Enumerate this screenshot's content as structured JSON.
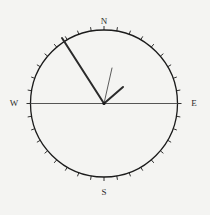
{
  "figure": {
    "name": "compass-rose-diagram",
    "background_color": "#f4f4f2",
    "width": 210,
    "height": 215
  },
  "compass": {
    "center_x": 104,
    "center_y": 103.5,
    "radius": 73.5,
    "circle_color": "#1b1b1b",
    "circle_stroke_width": 1.3,
    "tick_interval_degrees": 10,
    "tick_length": 4,
    "tick_color": "#1b1b1b",
    "tick_stroke_width": 0.9
  },
  "cardinals": [
    {
      "label": "N",
      "bearing": 0,
      "x": 104,
      "y": 22
    },
    {
      "label": "E",
      "bearing": 90,
      "x": 194,
      "y": 103.5
    },
    {
      "label": "S",
      "bearing": 180,
      "x": 104,
      "y": 193
    },
    {
      "label": "W",
      "bearing": 270,
      "x": 14,
      "y": 103.5
    }
  ],
  "axis_line": {
    "name": "west-east-axis",
    "x1": 30.5,
    "y1": 103.5,
    "x2": 177.5,
    "y2": 103.5,
    "color": "#555555",
    "stroke_width": 1.1
  },
  "vectors": {
    "main_radius": {
      "name": "main-direction-vector",
      "bearing_label": "330",
      "x1": 62,
      "y1": 38,
      "x2": 104,
      "y2": 103.5,
      "color": "#2a2a2a",
      "stroke_width": 2.0
    },
    "secondary_line": {
      "name": "secondary-thin-vector",
      "x1": 112,
      "y1": 68,
      "x2": 104,
      "y2": 103.5,
      "color": "#4a4a4a",
      "stroke_width": 0.9
    },
    "arrow_barb": {
      "name": "arrow-barb-segment",
      "x1": 104,
      "y1": 103.5,
      "x2": 123,
      "y2": 87,
      "color": "#2a2a2a",
      "stroke_width": 2.0
    }
  },
  "center_dot": {
    "name": "compass-center-point",
    "x": 104,
    "y": 103.5,
    "radius": 1.6,
    "color": "#1b1b1b"
  },
  "chart_data": {
    "type": "scatter",
    "title": "",
    "subtitle": "",
    "xlabel": "",
    "ylabel": "",
    "projection": "polar-compass",
    "grid": false,
    "legend_position": "none",
    "axis_ranges": {
      "bearing_degrees": [
        0,
        360
      ],
      "radius_normalized": [
        0,
        1
      ]
    },
    "tick_labels": [
      "N",
      "E",
      "S",
      "W"
    ],
    "tick_bearings": [
      0,
      90,
      180,
      270
    ],
    "minor_tick_interval_degrees": 10,
    "annotations": [
      {
        "name": "main-vector",
        "bearing_degrees": 327,
        "radius_normalized": 1.0
      },
      {
        "name": "secondary-vector",
        "bearing_degrees": 167,
        "radius_normalized": 0.5
      },
      {
        "name": "barb-vector",
        "bearing_degrees": 49,
        "radius_normalized": 0.34
      }
    ]
  }
}
